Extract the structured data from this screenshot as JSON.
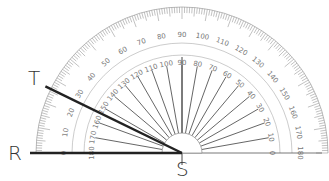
{
  "diagram": {
    "type": "protractor-angle-measurement",
    "points": {
      "R": {
        "label": "R",
        "x": 8,
        "y": 143
      },
      "T": {
        "label": "T",
        "x": 28,
        "y": 68
      },
      "S": {
        "label": "S",
        "x": 176,
        "y": 159
      }
    },
    "rays": [
      {
        "name": "SR",
        "from": "S",
        "to": "R",
        "angle_deg": 180
      },
      {
        "name": "ST",
        "from": "S",
        "to": "T",
        "angle_deg": 154
      }
    ],
    "protractor": {
      "center": [
        182,
        153
      ],
      "outer_radius": 146,
      "outer_scale_labels": [
        "0",
        "10",
        "20",
        "30",
        "40",
        "50",
        "60",
        "70",
        "80",
        "90",
        "100",
        "110",
        "120",
        "130",
        "140",
        "150",
        "160",
        "170",
        "180"
      ],
      "inner_scale_labels": [
        "180",
        "170",
        "160",
        "150",
        "140",
        "130",
        "120",
        "110",
        "100",
        "90",
        "80",
        "70",
        "60",
        "50",
        "40",
        "30",
        "20",
        "10",
        "0"
      ],
      "line_color": "#222222",
      "scale_color": "#888888"
    }
  }
}
